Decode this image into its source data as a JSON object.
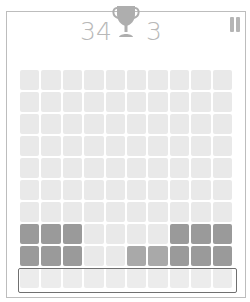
{
  "header": {
    "score": "34",
    "best": "3",
    "trophy_icon": "trophy-icon",
    "pause_icon": "pause-icon"
  },
  "board": {
    "columns": 10,
    "rows": 10,
    "colors": {
      "empty": "#e9e9e9",
      "filled_dark": "#9a9a9a",
      "filled_mid": "#a9a9a9",
      "highlight_border": "#707070",
      "text": "#b8b8b8"
    },
    "cells": [
      [
        "e",
        "e",
        "e",
        "e",
        "e",
        "e",
        "e",
        "e",
        "e",
        "e"
      ],
      [
        "e",
        "e",
        "e",
        "e",
        "e",
        "e",
        "e",
        "e",
        "e",
        "e"
      ],
      [
        "e",
        "e",
        "e",
        "e",
        "e",
        "e",
        "e",
        "e",
        "e",
        "e"
      ],
      [
        "e",
        "e",
        "e",
        "e",
        "e",
        "e",
        "e",
        "e",
        "e",
        "e"
      ],
      [
        "e",
        "e",
        "e",
        "e",
        "e",
        "e",
        "e",
        "e",
        "e",
        "e"
      ],
      [
        "e",
        "e",
        "e",
        "e",
        "e",
        "e",
        "e",
        "e",
        "e",
        "e"
      ],
      [
        "e",
        "e",
        "e",
        "e",
        "e",
        "e",
        "e",
        "e",
        "e",
        "e"
      ],
      [
        "d",
        "d",
        "d",
        "e",
        "e",
        "e",
        "e",
        "d",
        "d",
        "d"
      ],
      [
        "d",
        "d",
        "d",
        "e",
        "e",
        "m",
        "m",
        "d",
        "d",
        "d"
      ],
      [
        "e",
        "e",
        "e",
        "e",
        "e",
        "e",
        "e",
        "e",
        "e",
        "e"
      ]
    ],
    "highlighted_row": 9
  }
}
